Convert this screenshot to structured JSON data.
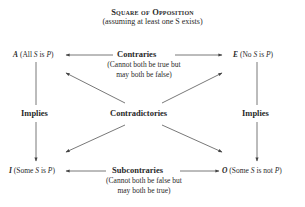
{
  "title": "Square of Opposition",
  "subtitle": "(assuming at least one S exists)",
  "corners": {
    "A": {
      "letter": "A",
      "desc_pre": " (All ",
      "s": "S",
      "mid": " is ",
      "p": "P",
      "post": ")"
    },
    "E": {
      "letter": "E",
      "desc_pre": " (No ",
      "s": "S",
      "mid": " is ",
      "p": "P",
      "post": ")"
    },
    "I": {
      "letter": "I",
      "desc_pre": " (Some ",
      "s": "S",
      "mid": " is ",
      "p": "P",
      "post": ")"
    },
    "O": {
      "letter": "O",
      "desc_pre": " (Some ",
      "s": "S",
      "mid": " is not ",
      "p": "P",
      "post": ")"
    }
  },
  "relations": {
    "contraries": {
      "label": "Contraries",
      "note_line1": "(Cannot both be true but",
      "note_line2": "may both be false)"
    },
    "subcontraries": {
      "label": "Subcontraries",
      "note_line1": "(Cannot both be false but",
      "note_line2": "may both be true)"
    },
    "contradictories": {
      "label": "Contradictories"
    },
    "implies_left": {
      "label": "Implies"
    },
    "implies_right": {
      "label": "Implies"
    }
  },
  "colors": {
    "line": "#555555",
    "text": "#2a2a2a"
  }
}
